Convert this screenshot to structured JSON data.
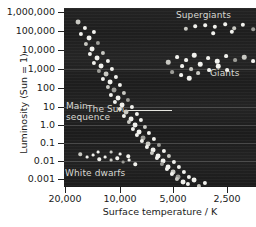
{
  "chart_data": {
    "type": "scatter",
    "title": "",
    "xlabel": "Surface temperature / K",
    "ylabel": "Luminosity (Sun = 1)",
    "x_scale": "log-reversed",
    "y_scale": "log",
    "xlim": [
      26000,
      2200
    ],
    "ylim": [
      0.0004,
      2500000
    ],
    "grid": "horizontal-faint",
    "legend": "none",
    "background": "#222222",
    "star_color": "#f2f2ee",
    "xticks": [
      {
        "label": "20,000",
        "value": 20000,
        "px": 65
      },
      {
        "label": "10,000",
        "value": 10000,
        "px": 120
      },
      {
        "label": "5,000",
        "value": 5000,
        "px": 173
      },
      {
        "label": "2,500",
        "value": 2500,
        "px": 227
      }
    ],
    "yticks": [
      {
        "label": "1,000,000",
        "value": 1000000,
        "px": 12
      },
      {
        "label": "100,000",
        "value": 100000,
        "px": 31
      },
      {
        "label": "10,000",
        "value": 10000,
        "px": 50
      },
      {
        "label": "1,000",
        "value": 1000,
        "px": 69
      },
      {
        "label": "100",
        "value": 100,
        "px": 88
      },
      {
        "label": "10",
        "value": 10,
        "px": 107
      },
      {
        "label": "1.0",
        "value": 1,
        "px": 125
      },
      {
        "label": "0.1",
        "value": 0.1,
        "px": 143
      },
      {
        "label": "0.01",
        "value": 0.01,
        "px": 161
      },
      {
        "label": "0.001",
        "value": 0.001,
        "px": 179
      }
    ],
    "gridlines_y_px": [
      69,
      107,
      125,
      143,
      161
    ],
    "annotations": [
      {
        "name": "main-sequence",
        "text": "Main\nsequence",
        "x_px": 66,
        "y_px": 101
      },
      {
        "name": "supergiants",
        "text": "Supergiants",
        "x_px": 176,
        "y_px": 10
      },
      {
        "name": "giants",
        "text": "Giants",
        "x_px": 210,
        "y_px": 68
      },
      {
        "name": "white-dwarfs",
        "text": "White dwarfs",
        "x_px": 65,
        "y_px": 168
      },
      {
        "name": "the-sun",
        "text": "The Sun",
        "x_px": 87,
        "y_px": 104
      }
    ],
    "series": [
      {
        "name": "Main sequence",
        "points_px": [
          [
            14,
            14
          ],
          [
            21,
            20
          ],
          [
            17,
            26
          ],
          [
            25,
            30
          ],
          [
            30,
            24
          ],
          [
            22,
            36
          ],
          [
            28,
            41
          ],
          [
            34,
            35
          ],
          [
            26,
            46
          ],
          [
            33,
            50
          ],
          [
            39,
            45
          ],
          [
            30,
            55
          ],
          [
            37,
            58
          ],
          [
            44,
            53
          ],
          [
            35,
            63
          ],
          [
            42,
            66
          ],
          [
            48,
            61
          ],
          [
            39,
            71
          ],
          [
            46,
            74
          ],
          [
            52,
            69
          ],
          [
            44,
            79
          ],
          [
            50,
            82
          ],
          [
            56,
            77
          ],
          [
            47,
            87
          ],
          [
            54,
            90
          ],
          [
            60,
            85
          ],
          [
            51,
            94
          ],
          [
            58,
            97
          ],
          [
            64,
            92
          ],
          [
            56,
            101
          ],
          [
            62,
            104
          ],
          [
            68,
            99
          ],
          [
            60,
            108
          ],
          [
            67,
            111
          ],
          [
            73,
            106
          ],
          [
            65,
            114
          ],
          [
            71,
            117
          ],
          [
            77,
            112
          ],
          [
            69,
            121
          ],
          [
            75,
            124
          ],
          [
            81,
            119
          ],
          [
            73,
            127
          ],
          [
            79,
            130
          ],
          [
            85,
            125
          ],
          [
            78,
            133
          ],
          [
            84,
            136
          ],
          [
            90,
            131
          ],
          [
            83,
            139
          ],
          [
            89,
            142
          ],
          [
            95,
            137
          ],
          [
            88,
            145
          ],
          [
            94,
            148
          ],
          [
            100,
            143
          ],
          [
            93,
            150
          ],
          [
            99,
            153
          ],
          [
            105,
            148
          ],
          [
            98,
            156
          ],
          [
            104,
            159
          ],
          [
            110,
            154
          ],
          [
            103,
            161
          ],
          [
            109,
            164
          ],
          [
            115,
            159
          ],
          [
            108,
            166
          ],
          [
            114,
            169
          ],
          [
            120,
            164
          ],
          [
            113,
            171
          ],
          [
            119,
            174
          ],
          [
            125,
            169
          ],
          [
            124,
            176
          ],
          [
            130,
            172
          ],
          [
            135,
            178
          ],
          [
            141,
            175
          ]
        ]
      },
      {
        "name": "Supergiants",
        "points_px": [
          [
            122,
            21
          ],
          [
            131,
            18
          ],
          [
            141,
            17
          ],
          [
            151,
            19
          ],
          [
            161,
            16
          ],
          [
            170,
            20
          ],
          [
            179,
            17
          ],
          [
            189,
            21
          ],
          [
            149,
            25
          ],
          [
            168,
            24
          ]
        ]
      },
      {
        "name": "Giants",
        "points_px": [
          [
            104,
            54
          ],
          [
            113,
            49
          ],
          [
            122,
            52
          ],
          [
            130,
            47
          ],
          [
            118,
            58
          ],
          [
            127,
            61
          ],
          [
            136,
            56
          ],
          [
            108,
            64
          ],
          [
            117,
            67
          ],
          [
            125,
            70
          ],
          [
            134,
            65
          ],
          [
            144,
            50
          ],
          [
            153,
            53
          ],
          [
            162,
            48
          ],
          [
            171,
            52
          ],
          [
            180,
            49
          ],
          [
            189,
            53
          ],
          [
            145,
            62
          ],
          [
            154,
            58
          ],
          [
            163,
            62
          ]
        ]
      },
      {
        "name": "White dwarfs",
        "points_px": [
          [
            16,
            146
          ],
          [
            23,
            149
          ],
          [
            29,
            147
          ],
          [
            35,
            151
          ],
          [
            41,
            149
          ],
          [
            47,
            152
          ],
          [
            53,
            150
          ],
          [
            59,
            154
          ],
          [
            65,
            152
          ],
          [
            71,
            156
          ],
          [
            47,
            144
          ],
          [
            56,
            146
          ],
          [
            64,
            148
          ],
          [
            34,
            144
          ]
        ]
      }
    ]
  }
}
